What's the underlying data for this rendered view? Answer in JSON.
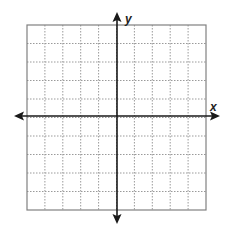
{
  "chart_data": {
    "type": "coordinate_grid",
    "title": "",
    "xlabel": "x",
    "ylabel": "y",
    "grid": true,
    "grid_style": "dotted",
    "columns": 10,
    "rows": 10,
    "xlim": [
      -5,
      5
    ],
    "ylim": [
      -5,
      5
    ],
    "tick_labels": [],
    "arrows": [
      "left",
      "right",
      "up",
      "down"
    ]
  },
  "labels": {
    "x_axis": "x",
    "y_axis": "y"
  },
  "colors": {
    "background": "#ffffff",
    "grid_line": "#9a9a9a",
    "border": "#808080",
    "axis": "#1a1a1a"
  }
}
